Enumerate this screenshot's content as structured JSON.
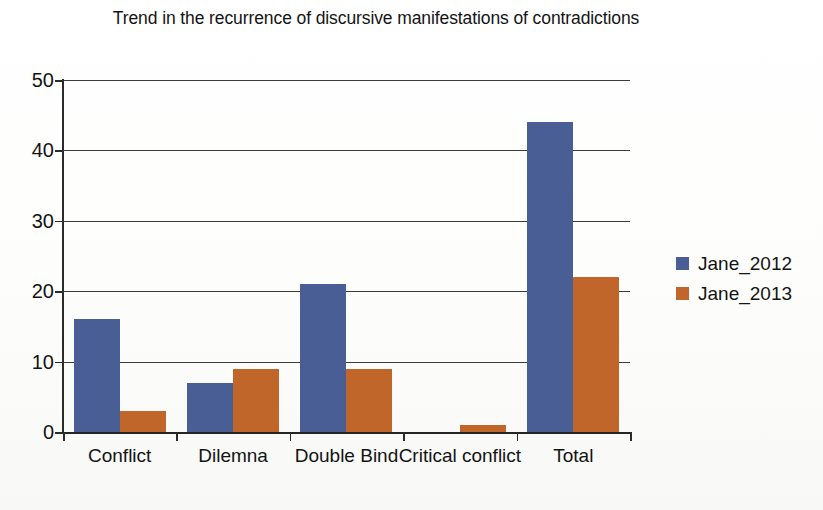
{
  "chart_data": {
    "type": "bar",
    "title": "Trend in the recurrence of discursive manifestations of contradictions",
    "xlabel": "",
    "ylabel": "",
    "categories": [
      "Conflict",
      "Dilemna",
      "Double Bind",
      "Critical conflict",
      "Total"
    ],
    "series": [
      {
        "name": "Jane_2012",
        "color": "#4a5e96",
        "values": [
          16,
          7,
          21,
          0,
          44
        ]
      },
      {
        "name": "Jane_2013",
        "color": "#c0662a",
        "values": [
          3,
          9,
          9,
          1,
          22
        ]
      }
    ],
    "ylim": [
      0,
      50
    ],
    "ytick_labels": [
      "0",
      "10",
      "20",
      "30",
      "40",
      "50"
    ],
    "ytick_values": [
      0,
      10,
      20,
      30,
      40,
      50
    ],
    "grid": true,
    "legend_position": "right"
  },
  "legend": {
    "entries": [
      {
        "label": "Jane_2012"
      },
      {
        "label": "Jane_2013"
      }
    ]
  }
}
